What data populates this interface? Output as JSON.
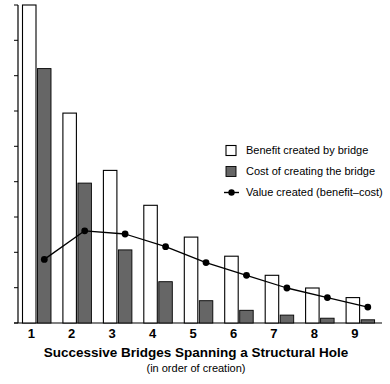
{
  "chart_data": {
    "type": "bar",
    "title": "Successive Bridges Spanning a Structural Hole",
    "subtitle": "(in order of creation)",
    "xlabel": "Successive Bridges Spanning a Structural Hole",
    "ylabel": "",
    "grid": false,
    "legend_position": "upper-right",
    "categories": [
      "1",
      "2",
      "3",
      "4",
      "5",
      "6",
      "7",
      "8",
      "9"
    ],
    "ylim": [
      0,
      100
    ],
    "xlim_note": "categorical, 9 successive bridges",
    "series": [
      {
        "name": "Benefit created by bridge",
        "type": "bar",
        "style": "white-fill-black-outline",
        "color": "#ffffff",
        "edge_color": "#000000",
        "values": [
          100,
          66,
          48,
          37,
          27,
          21,
          15,
          11,
          8
        ]
      },
      {
        "name": "Cost of creating the bridge",
        "type": "bar",
        "style": "gray-fill",
        "color": "#666666",
        "edge_color": "#000000",
        "values": [
          80,
          44,
          23,
          13,
          7,
          4,
          2.5,
          1.5,
          1
        ]
      },
      {
        "name": "Value created (benefit–cost)",
        "type": "line",
        "style": "line-with-round-markers",
        "color": "#000000",
        "marker": "circle",
        "values": [
          20,
          29,
          28,
          24,
          19,
          15,
          11,
          8,
          5
        ]
      }
    ],
    "legend": [
      {
        "label": "Benefit created by bridge",
        "swatch": "open-square",
        "color": "#ffffff"
      },
      {
        "label": "Cost of creating the bridge",
        "swatch": "filled-square",
        "color": "#666666"
      },
      {
        "label": "Value created (benefit–cost)",
        "swatch": "line-marker",
        "color": "#000000"
      }
    ],
    "axis": {
      "y_tick_count": 9,
      "y_tick_labels": [],
      "x_tick_labels": [
        "1",
        "2",
        "3",
        "4",
        "5",
        "6",
        "7",
        "8",
        "9"
      ]
    }
  },
  "colors": {
    "cost_fill": "#666666",
    "benefit_fill": "#ffffff",
    "stroke": "#000000",
    "background": "#ffffff"
  }
}
